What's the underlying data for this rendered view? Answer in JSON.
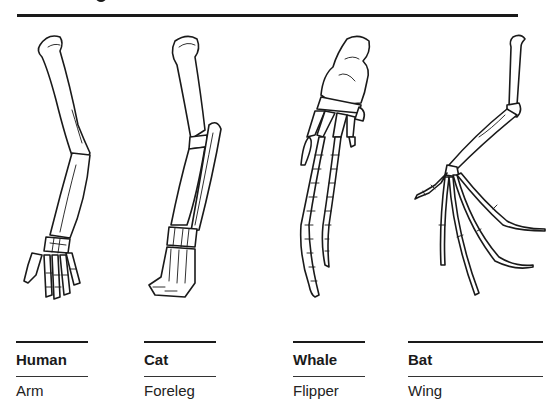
{
  "diagram": {
    "topic": "Homologous forelimb structures",
    "colors": {
      "line": "#1a1a1a",
      "background": "#ffffff"
    },
    "columns": [
      {
        "animal": "Human",
        "limb": "Arm",
        "drawing": "human-arm-skeleton"
      },
      {
        "animal": "Cat",
        "limb": "Foreleg",
        "drawing": "cat-foreleg-skeleton"
      },
      {
        "animal": "Whale",
        "limb": "Flipper",
        "drawing": "whale-flipper-skeleton"
      },
      {
        "animal": "Bat",
        "limb": "Wing",
        "drawing": "bat-wing-skeleton"
      }
    ]
  }
}
